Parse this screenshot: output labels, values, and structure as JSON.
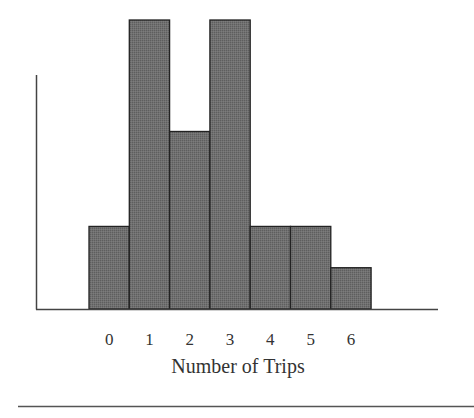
{
  "chart_data": {
    "type": "bar",
    "subtype": "histogram",
    "title": "",
    "xlabel": "Number of Trips",
    "ylabel": "",
    "categories": [
      "0",
      "1",
      "2",
      "3",
      "4",
      "5",
      "6"
    ],
    "values": [
      2,
      7,
      4.3,
      7,
      2,
      2,
      1
    ],
    "ylim": [
      0,
      7
    ],
    "y_ticks_shown": false,
    "grid": false,
    "legend": "none",
    "bar_fill": "#6f6f6f",
    "bar_outline": "#222222"
  }
}
